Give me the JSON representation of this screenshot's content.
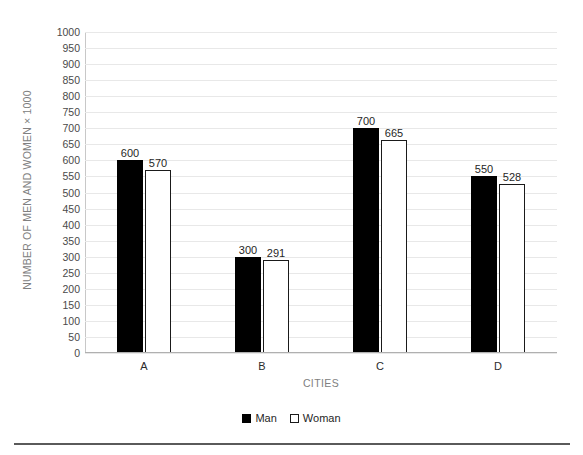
{
  "chart_data": {
    "type": "bar",
    "title": "",
    "subtitle": "",
    "xlabel": "CITIES",
    "ylabel": "NUMBER OF MEN AND WOMEN × 1000",
    "categories": [
      "A",
      "B",
      "C",
      "D"
    ],
    "series": [
      {
        "name": "Man",
        "values": [
          600,
          300,
          700,
          550
        ],
        "color": "#000000",
        "style": "filled"
      },
      {
        "name": "Woman",
        "values": [
          570,
          291,
          665,
          528
        ],
        "color": "#ffffff",
        "style": "outlined"
      }
    ],
    "ylim": [
      0,
      1000
    ],
    "ytick_step": 50,
    "yticks": [
      0,
      50,
      100,
      150,
      200,
      250,
      300,
      350,
      400,
      450,
      500,
      550,
      600,
      650,
      700,
      750,
      800,
      850,
      900,
      950,
      1000
    ],
    "ytick_labels": [
      "0",
      "50",
      "100",
      "150",
      "200",
      "250",
      "300",
      "350",
      "400",
      "450",
      "500",
      "550",
      "600",
      "650",
      "700",
      "750",
      "800",
      "850",
      "900",
      "950",
      "1000"
    ],
    "grid": true,
    "grid_axis": "y",
    "legend_position": "bottom",
    "data_labels": true,
    "data_label_values": [
      [
        "600",
        "570"
      ],
      [
        "300",
        "291"
      ],
      [
        "700",
        "665"
      ],
      [
        "550",
        "528"
      ]
    ]
  },
  "legend": {
    "items": [
      {
        "label": "Man",
        "marker": "filled-square"
      },
      {
        "label": "Woman",
        "marker": "outlined-square"
      }
    ]
  },
  "colors": {
    "man": "#000000",
    "woman": "#ffffff",
    "grid": "#e8e8e8",
    "axis": "#b0b0b0",
    "axis_title": "#808080",
    "tick_label": "#4a4a4a"
  }
}
